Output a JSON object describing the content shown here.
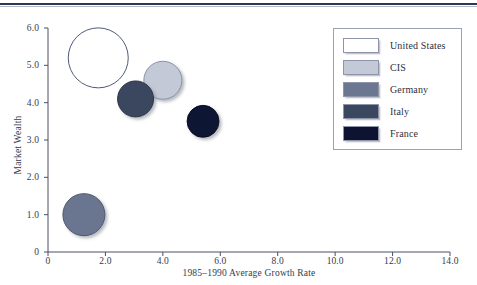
{
  "figure": {
    "top_rule": true,
    "top_text_fragment": ""
  },
  "chart_data": {
    "type": "scatter",
    "variant": "bubble",
    "title": "",
    "xlabel": "1985–1990 Average Growth Rate",
    "ylabel": "Market Wealth",
    "xlim": [
      0,
      14.0
    ],
    "ylim": [
      0,
      6.0
    ],
    "grid": false,
    "legend_position": "upper-right",
    "xticks": [
      {
        "value": 0,
        "label": "0"
      },
      {
        "value": 2.0,
        "label": "2.0"
      },
      {
        "value": 4.0,
        "label": "4.0"
      },
      {
        "value": 6.0,
        "label": "6.0"
      },
      {
        "value": 8.0,
        "label": "8.0"
      },
      {
        "value": 10.0,
        "label": "10.0"
      },
      {
        "value": 12.0,
        "label": "12.0"
      },
      {
        "value": 14.0,
        "label": "14.0"
      }
    ],
    "yticks": [
      {
        "value": 0,
        "label": "0"
      },
      {
        "value": 1.0,
        "label": "1.0"
      },
      {
        "value": 2.0,
        "label": "2.0"
      },
      {
        "value": 3.0,
        "label": "3.0"
      },
      {
        "value": 4.0,
        "label": "4.0"
      },
      {
        "value": 5.0,
        "label": "5.0"
      },
      {
        "value": 6.0,
        "label": "6.0"
      }
    ],
    "series": [
      {
        "name": "United States",
        "x": 1.75,
        "y": 5.2,
        "radius_px": 30,
        "color": "#ffffff",
        "edge_color": "#505a78"
      },
      {
        "name": "CIS",
        "x": 4.0,
        "y": 4.6,
        "radius_px": 19,
        "color": "#c3c9d6",
        "edge_color": "#8b93a8"
      },
      {
        "name": "Germany",
        "x": 1.25,
        "y": 1.0,
        "radius_px": 21,
        "color": "#6b7690",
        "edge_color": "#4d566d"
      },
      {
        "name": "Italy",
        "x": 3.05,
        "y": 4.1,
        "radius_px": 18,
        "color": "#3b475f",
        "edge_color": "#2c3648"
      },
      {
        "name": "France",
        "x": 5.4,
        "y": 3.5,
        "radius_px": 16,
        "color": "#0d1330",
        "edge_color": "#0a0f26"
      }
    ]
  },
  "legend": {
    "items": [
      {
        "label": "United States",
        "color": "#ffffff"
      },
      {
        "label": "CIS",
        "color": "#c3c9d6"
      },
      {
        "label": "Germany",
        "color": "#6b7690"
      },
      {
        "label": "Italy",
        "color": "#3b475f"
      },
      {
        "label": "France",
        "color": "#0d1330"
      }
    ]
  },
  "colors": {
    "axis": "#4a5068",
    "text": "#2b3140",
    "rule": "#2e3656"
  }
}
